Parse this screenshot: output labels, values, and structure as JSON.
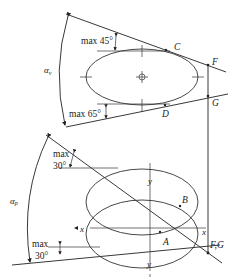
{
  "diagram": {
    "top_view": {
      "angle_label": "αv",
      "angle_symbol": "α",
      "angle_sub": "v",
      "upper_limit_label": "max 45°",
      "lower_limit_label": "max 65°",
      "points": {
        "C": "C",
        "D": "D",
        "F": "F",
        "G": "G"
      }
    },
    "bottom_view": {
      "angle_label": "αp",
      "angle_symbol": "α",
      "angle_sub": "p",
      "upper_limit_label_line1": "max",
      "upper_limit_label_line2": "30°",
      "lower_limit_label_line1": "max",
      "lower_limit_label_line2": "30°",
      "points": {
        "A": "A",
        "B": "B",
        "FG": "F,G"
      },
      "axes": {
        "x_left": "x",
        "x_right": "x",
        "y_top": "y",
        "y_bottom": "y"
      }
    },
    "colors": {
      "line": "#222222",
      "background": "#ffffff"
    }
  }
}
